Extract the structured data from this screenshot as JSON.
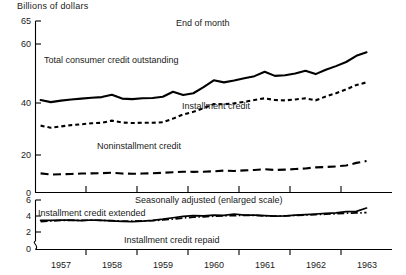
{
  "figure": {
    "y_axis_title": "Billions of dollars",
    "top_panel_note": "End of month",
    "bottom_panel_note": "Seasonally adjusted (enlarged scale)"
  },
  "labels": {
    "total": "Total consumer credit outstanding",
    "installment": "Installment credit",
    "noninstallment": "Noninstallment credit",
    "extended": "Installment credit extended",
    "repaid": "Installment credit repaid"
  },
  "axes": {
    "top_ticks": [
      "65",
      "60",
      "40",
      "20",
      "0"
    ],
    "bottom_ticks": [
      "6",
      "4",
      "2",
      "0"
    ],
    "x_ticks": [
      "1957",
      "1958",
      "1959",
      "1960",
      "1961",
      "1962",
      "1963"
    ]
  },
  "chart_data": [
    {
      "type": "line",
      "title": "End of month",
      "subtitle": "",
      "xlabel": "",
      "ylabel": "Billions of dollars",
      "xlim": [
        1956.5,
        1963.5
      ],
      "ylim": [
        0,
        65
      ],
      "ytick_values": [
        0,
        20,
        40,
        60,
        65
      ],
      "xtick_values": [
        1957,
        1958,
        1959,
        1960,
        1961,
        1962,
        1963
      ],
      "xtick_labels": [
        "1957",
        "1958",
        "1959",
        "1960",
        "1961",
        "1962",
        "1963"
      ],
      "grid": false,
      "legend": "inline-annotations",
      "x": [
        1956.6,
        1956.8,
        1957.0,
        1957.2,
        1957.4,
        1957.6,
        1957.8,
        1958.0,
        1958.2,
        1958.4,
        1958.6,
        1958.8,
        1959.0,
        1959.2,
        1959.4,
        1959.6,
        1959.8,
        1960.0,
        1960.2,
        1960.4,
        1960.6,
        1960.8,
        1961.0,
        1961.2,
        1961.4,
        1961.6,
        1961.8,
        1962.0,
        1962.2,
        1962.4,
        1962.6,
        1962.8,
        1963.0
      ],
      "series": [
        {
          "name": "Total consumer credit outstanding",
          "style": "solid",
          "values": [
            41.0,
            40.3,
            40.8,
            41.2,
            41.5,
            41.8,
            42.0,
            42.8,
            41.5,
            41.3,
            41.6,
            41.7,
            42.1,
            43.8,
            42.7,
            43.3,
            45.4,
            47.7,
            47.0,
            47.6,
            48.4,
            49.1,
            50.6,
            49.2,
            49.4,
            50.0,
            50.9,
            49.8,
            51.3,
            52.5,
            53.9,
            56.0,
            57.2
          ]
        },
        {
          "name": "Installment credit",
          "style": "dashed",
          "values": [
            31.3,
            30.5,
            31.0,
            31.5,
            31.8,
            32.2,
            32.4,
            33.2,
            32.5,
            32.3,
            32.4,
            32.4,
            32.6,
            34.0,
            35.6,
            36.6,
            38.0,
            39.6,
            39.5,
            39.9,
            40.4,
            41.0,
            41.6,
            41.0,
            40.9,
            41.2,
            41.6,
            40.9,
            42.2,
            43.3,
            44.6,
            46.1,
            47.0
          ]
        },
        {
          "name": "Noninstallment credit",
          "style": "longdash",
          "values": [
            10.2,
            9.6,
            9.7,
            9.9,
            10.1,
            10.2,
            10.3,
            10.6,
            10.1,
            10.0,
            10.1,
            10.3,
            10.5,
            10.8,
            11.1,
            11.0,
            11.1,
            11.3,
            11.7,
            11.5,
            11.8,
            12.0,
            12.4,
            12.0,
            12.2,
            12.5,
            12.8,
            13.4,
            13.6,
            13.9,
            14.4,
            15.8,
            16.8
          ]
        }
      ]
    },
    {
      "type": "line",
      "title": "Seasonally adjusted (enlarged scale)",
      "xlabel": "",
      "ylabel": "Billions of dollars",
      "xlim": [
        1956.5,
        1963.5
      ],
      "ylim": [
        0,
        6
      ],
      "axis_break": "between 0 and 2",
      "ytick_values": [
        0,
        2,
        4,
        6
      ],
      "xtick_values": [
        1957,
        1958,
        1959,
        1960,
        1961,
        1962,
        1963
      ],
      "xtick_labels": [
        "1957",
        "1958",
        "1959",
        "1960",
        "1961",
        "1962",
        "1963"
      ],
      "grid": false,
      "legend": "inline-annotations",
      "x": [
        1956.6,
        1956.8,
        1957.0,
        1957.2,
        1957.4,
        1957.6,
        1957.8,
        1958.0,
        1958.2,
        1958.4,
        1958.6,
        1958.8,
        1959.0,
        1959.2,
        1959.4,
        1959.6,
        1959.8,
        1960.0,
        1960.2,
        1960.4,
        1960.6,
        1960.8,
        1961.0,
        1961.2,
        1961.4,
        1961.6,
        1961.8,
        1962.0,
        1962.2,
        1962.4,
        1962.6,
        1962.8,
        1963.0
      ],
      "series": [
        {
          "name": "Installment credit extended",
          "style": "solid",
          "values": [
            3.45,
            3.45,
            3.5,
            3.48,
            3.42,
            3.5,
            3.45,
            3.4,
            3.32,
            3.3,
            3.35,
            3.45,
            3.6,
            3.78,
            3.95,
            4.05,
            4.02,
            4.1,
            4.08,
            4.25,
            4.12,
            4.1,
            4.05,
            3.98,
            4.0,
            4.12,
            4.18,
            4.25,
            4.32,
            4.4,
            4.55,
            4.58,
            5.0
          ]
        },
        {
          "name": "Installment credit repaid",
          "style": "dashdot",
          "values": [
            3.3,
            3.38,
            3.45,
            3.47,
            3.45,
            3.48,
            3.45,
            3.42,
            3.35,
            3.35,
            3.38,
            3.42,
            3.5,
            3.62,
            3.75,
            3.85,
            3.9,
            3.98,
            4.02,
            4.05,
            4.08,
            4.08,
            4.02,
            3.98,
            4.02,
            4.08,
            4.12,
            4.18,
            4.22,
            4.28,
            4.35,
            4.38,
            4.42
          ]
        }
      ]
    }
  ]
}
